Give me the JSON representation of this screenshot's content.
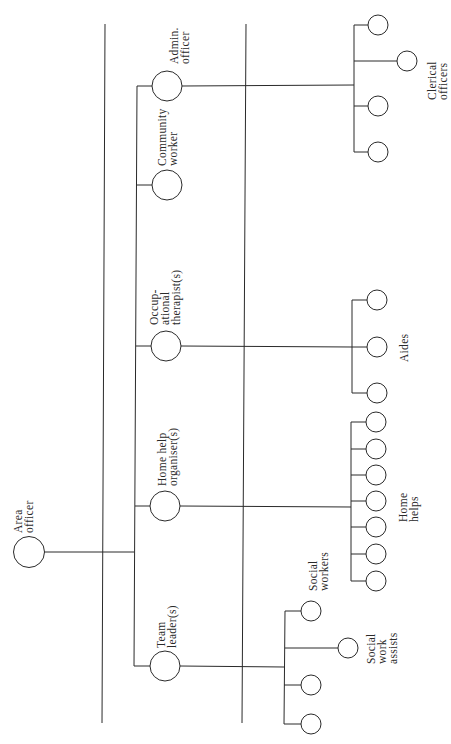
{
  "diagram": {
    "type": "organisation-chart",
    "orientation": "rotated-90-ccw",
    "colors": {
      "line": "#2a2a2a",
      "background": "#ffffff"
    },
    "root": {
      "label_line1": "Area",
      "label_line2": "officer"
    },
    "managers": [
      {
        "id": "team-leader",
        "label_line1": "Team",
        "label_line2": "leader(s)"
      },
      {
        "id": "home-help-organiser",
        "label_line1": "Home help",
        "label_line2": "organiser(s)"
      },
      {
        "id": "occupational-therapist",
        "label_line1": "Occup-",
        "label_line2": "ational",
        "label_line3": "therapist(s)"
      },
      {
        "id": "community-worker",
        "label_line1": "Community",
        "label_line2": "worker"
      },
      {
        "id": "admin-officer",
        "label_line1": "Admin.",
        "label_line2": "officer"
      }
    ],
    "staff_groups": [
      {
        "id": "social-workers",
        "parent": "team-leader",
        "label_line1": "Social",
        "label_line2": "workers",
        "count": 3
      },
      {
        "id": "social-work-assists",
        "parent": "team-leader",
        "label_line1": "Social",
        "label_line2": "work",
        "label_line3": "assists",
        "count": 1
      },
      {
        "id": "home-helps",
        "parent": "home-help-organiser",
        "label_line1": "Home",
        "label_line2": "helps",
        "count": 7
      },
      {
        "id": "aides",
        "parent": "occupational-therapist",
        "label_line1": "Aides",
        "count": 3
      },
      {
        "id": "clerical-officers",
        "parent": "admin-officer",
        "label_line1": "Clerical",
        "label_line2": "officers",
        "count": 4
      }
    ]
  }
}
